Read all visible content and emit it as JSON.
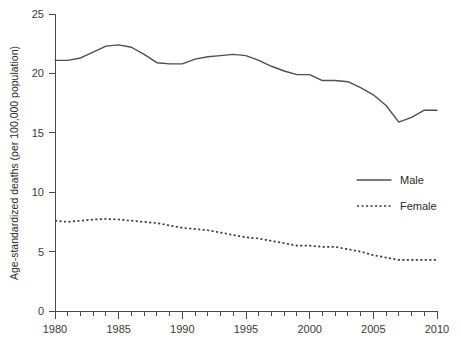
{
  "chart_data": {
    "type": "line",
    "title": "",
    "xlabel": "",
    "ylabel": "Age-standardized deaths (per 100,000 population)",
    "xlim": [
      1980,
      2010
    ],
    "ylim": [
      0,
      25
    ],
    "grid": false,
    "legend_position": "right-middle",
    "x_ticks_major": [
      1980,
      1985,
      1990,
      1995,
      2000,
      2005,
      2010
    ],
    "x_tick_labels": [
      "1980",
      "1985",
      "1990",
      "1995",
      "2000",
      "2005",
      "2010"
    ],
    "x_ticks_minor_step": 1,
    "y_ticks": [
      0,
      5,
      10,
      15,
      20,
      25
    ],
    "y_tick_labels": [
      "0",
      "5",
      "10",
      "15",
      "20",
      "25"
    ],
    "x": [
      1980,
      1981,
      1982,
      1983,
      1984,
      1985,
      1986,
      1987,
      1988,
      1989,
      1990,
      1991,
      1992,
      1993,
      1994,
      1995,
      1996,
      1997,
      1998,
      1999,
      2000,
      2001,
      2002,
      2003,
      2004,
      2005,
      2006,
      2007,
      2008,
      2009,
      2010
    ],
    "series": [
      {
        "name": "Male",
        "style": "solid",
        "color": "#4f4f4f",
        "values": [
          21.1,
          21.1,
          21.3,
          21.8,
          22.3,
          22.4,
          22.2,
          21.6,
          20.9,
          20.8,
          20.8,
          21.2,
          21.4,
          21.5,
          21.6,
          21.5,
          21.1,
          20.6,
          20.2,
          19.9,
          19.9,
          19.4,
          19.4,
          19.3,
          18.8,
          18.2,
          17.3,
          15.9,
          16.3,
          16.9,
          16.9
        ]
      },
      {
        "name": "Female",
        "style": "dotted",
        "color": "#3a3a3a",
        "values": [
          7.6,
          7.5,
          7.6,
          7.7,
          7.75,
          7.7,
          7.6,
          7.5,
          7.4,
          7.2,
          7.0,
          6.9,
          6.8,
          6.6,
          6.4,
          6.2,
          6.1,
          5.9,
          5.7,
          5.5,
          5.5,
          5.4,
          5.4,
          5.2,
          5.0,
          4.7,
          4.5,
          4.3,
          4.3,
          4.3,
          4.3
        ]
      }
    ]
  },
  "legend": {
    "items": [
      {
        "label": "Male",
        "style": "solid"
      },
      {
        "label": "Female",
        "style": "dotted"
      }
    ]
  }
}
